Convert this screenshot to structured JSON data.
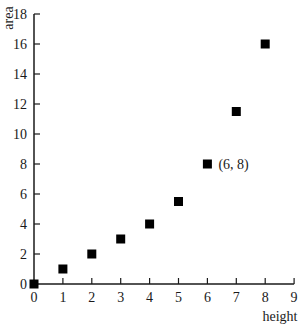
{
  "chart_data": {
    "type": "scatter",
    "title": "",
    "xlabel": "height",
    "ylabel": "area",
    "xlim": [
      0,
      9
    ],
    "ylim": [
      0,
      18
    ],
    "x_ticks": [
      "0",
      "1",
      "2",
      "3",
      "4",
      "5",
      "6",
      "7",
      "8",
      "9"
    ],
    "y_ticks": [
      "0",
      "2",
      "4",
      "6",
      "8",
      "10",
      "12",
      "14",
      "16",
      "18"
    ],
    "grid": false,
    "legend": null,
    "marker": "square",
    "series": [
      {
        "name": "area vs height",
        "x": [
          0,
          1,
          2,
          3,
          4,
          5,
          6,
          7,
          8
        ],
        "y": [
          0,
          1,
          2,
          3,
          4,
          5.5,
          8,
          11.5,
          16
        ]
      }
    ],
    "annotations": [
      {
        "text": "(6, 8)",
        "x": 6,
        "y": 8
      }
    ]
  },
  "colors": {
    "axis": "#1a1a1a",
    "marker": "#000000",
    "background": "#ffffff"
  }
}
